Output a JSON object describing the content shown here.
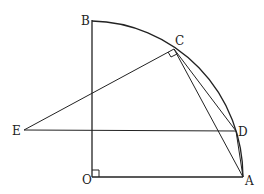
{
  "diagram": {
    "type": "geometry",
    "points": {
      "O": {
        "label": "O",
        "x": 92,
        "y": 177
      },
      "A": {
        "label": "A",
        "x": 243,
        "y": 177
      },
      "B": {
        "label": "B",
        "x": 92,
        "y": 20
      },
      "C": {
        "label": "C",
        "x": 174,
        "y": 49
      },
      "D": {
        "label": "D",
        "x": 236,
        "y": 131
      },
      "E": {
        "label": "E",
        "x": 24,
        "y": 130
      }
    },
    "segments": [
      "OB",
      "OA",
      "EC",
      "ED",
      "CD",
      "CA",
      "DA"
    ],
    "arc": {
      "center": "O",
      "from": "B",
      "to": "A",
      "through": [
        "C",
        "D"
      ]
    },
    "right_angles": [
      "O",
      "C"
    ],
    "colors": {
      "stroke": "#222222",
      "background": "#ffffff"
    }
  }
}
